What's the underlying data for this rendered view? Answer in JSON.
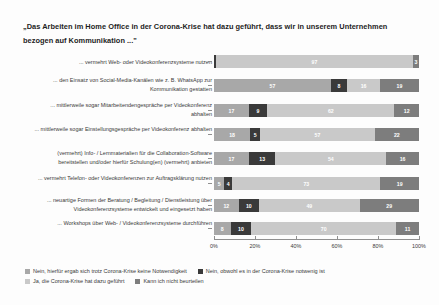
{
  "title": "„Das Arbeiten im Home Office in der Corona-Krise hat dazu geführt, dass wir in unserem Unternehmen bezogen auf Kommunikation ...\"",
  "axis": {
    "ticks": [
      "0%",
      "20%",
      "40%",
      "60%",
      "80%",
      "100%"
    ]
  },
  "legend": {
    "line1": [
      {
        "label": "Nein, hierfür ergab sich trotz Corona-Krise keine Notwendigkeit",
        "color": "#a8a8a8"
      },
      {
        "label": "Nein, obwohl es in der Corona-Krise notwenig ist",
        "color": "#3a3a3a"
      }
    ],
    "line2": [
      {
        "label": "Ja, die Corona-Krise hat dazu geführt",
        "color": "#c9c9c9"
      },
      {
        "label": "Kann ich nicht beurteilen",
        "color": "#7d7d7d"
      }
    ]
  },
  "rows": [
    {
      "label": "... vermehrt Web- oder Videokonferenzsysteme nutzen",
      "values": [
        0,
        1,
        97,
        3
      ],
      "labels": [
        "",
        "",
        "97",
        "3"
      ]
    },
    {
      "label": "... den Einsatz von Social-Media-Kanälen wie z. B. WhatsApp zur Kommunikation gestatten",
      "values": [
        57,
        8,
        16,
        19
      ],
      "labels": [
        "57",
        "8",
        "16",
        "19"
      ]
    },
    {
      "label": "... mittlerweile sogar Mitarbeitendengespräche per Videokonferenz abhalten",
      "values": [
        17,
        9,
        62,
        12
      ],
      "labels": [
        "17",
        "9",
        "62",
        "12"
      ]
    },
    {
      "label": "... mittlerweile sogar Einstellungsgespräche per Videokonferenz abhalten",
      "values": [
        18,
        5,
        57,
        22
      ],
      "labels": [
        "18",
        "5",
        "57",
        "22"
      ]
    },
    {
      "label": "(vermehrt) Info- / Lernmaterialien für die Collaboration-Software bereitstellen und/oder hierfür Schulung(en) (vermehrt) anbieten",
      "values": [
        17,
        13,
        54,
        16
      ],
      "labels": [
        "17",
        "13",
        "54",
        "16"
      ]
    },
    {
      "label": "... vermehrt Telefon- oder Videokonferenzen zur Auftragsklärung nutzen",
      "values": [
        5,
        4,
        73,
        19
      ],
      "labels": [
        "5",
        "4",
        "73",
        "19"
      ]
    },
    {
      "label": "... neuartige Formen der Beratung / Begleitung / Dienstleistung über Videokonferenzsysteme entwickelt und eingesetzt haben",
      "values": [
        12,
        10,
        49,
        29
      ],
      "labels": [
        "12",
        "10",
        "49",
        "29"
      ]
    },
    {
      "label": "... Workshops über Web- / Videokonferenzsysteme durchführen",
      "values": [
        8,
        10,
        70,
        11
      ],
      "labels": [
        "8",
        "10",
        "70",
        "11"
      ]
    }
  ],
  "chart_data": {
    "type": "bar",
    "title": "„Das Arbeiten im Home Office in der Corona-Krise hat dazu geführt, dass wir in unserem Unternehmen bezogen auf Kommunikation ...\"",
    "subtitle": "",
    "orientation": "horizontal",
    "stacked": "100-percent",
    "xlabel": "",
    "ylabel": "",
    "xlim": [
      0,
      100
    ],
    "xticks": [
      0,
      20,
      40,
      60,
      80,
      100
    ],
    "xtick_labels": [
      "0%",
      "20%",
      "40%",
      "60%",
      "80%",
      "100%"
    ],
    "grid": false,
    "legend_position": "bottom-left",
    "categories": [
      "... vermehrt Web- oder Videokonferenzsysteme nutzen",
      "... den Einsatz von Social-Media-Kanälen wie z. B. WhatsApp zur Kommunikation gestatten",
      "... mittlerweile sogar Mitarbeitendengespräche per Videokonferenz abhalten",
      "... mittlerweile sogar Einstellungsgespräche per Videokonferenz abhalten",
      "(vermehrt) Info- / Lernmaterialien für die Collaboration-Software bereitstellen und/oder hierfür Schulung(en) (vermehrt) anbieten",
      "... vermehrt Telefon- oder Videokonferenzen zur Auftragsklärung nutzen",
      "... neuartige Formen der Beratung / Begleitung / Dienstleistung über Videokonferenzsysteme entwickelt und eingesetzt haben",
      "... Workshops über Web- / Videokonferenzsysteme durchführen"
    ],
    "series": [
      {
        "name": "Nein, hierfür ergab sich trotz Corona-Krise keine Notwendigkeit",
        "color": "#a8a8a8",
        "values": [
          0,
          57,
          17,
          18,
          17,
          5,
          12,
          8
        ]
      },
      {
        "name": "Nein, obwohl es in der Corona-Krise notwenig ist",
        "color": "#3a3a3a",
        "values": [
          1,
          8,
          9,
          5,
          13,
          4,
          10,
          10
        ]
      },
      {
        "name": "Ja, die Corona-Krise hat dazu geführt",
        "color": "#c9c9c9",
        "values": [
          97,
          16,
          62,
          57,
          54,
          73,
          49,
          70
        ]
      },
      {
        "name": "Kann ich nicht beurteilen",
        "color": "#7d7d7d",
        "values": [
          3,
          19,
          12,
          22,
          16,
          19,
          29,
          11
        ]
      }
    ]
  }
}
